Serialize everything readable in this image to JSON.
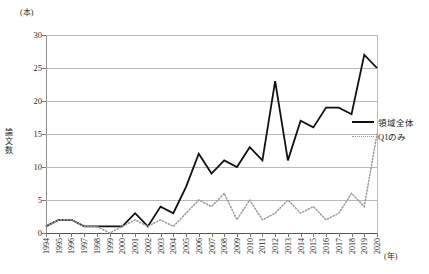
{
  "chart_data": {
    "type": "line",
    "title": "",
    "xlabel": "(年)",
    "ylabel": "論文数",
    "yunit": "(本)",
    "ylim": [
      0,
      30
    ],
    "yticks": [
      0,
      5,
      10,
      15,
      20,
      25,
      30
    ],
    "grid": true,
    "legend_position": "right",
    "categories": [
      "1994",
      "1995",
      "1996",
      "1997",
      "1998",
      "1999",
      "2000",
      "2001",
      "2002",
      "2003",
      "2004",
      "2005",
      "2006",
      "2007",
      "2008",
      "2009",
      "2010",
      "2011",
      "2012",
      "2013",
      "2014",
      "2015",
      "2016",
      "2017",
      "2018",
      "2019",
      "2020"
    ],
    "xtick_labels": [
      "1994",
      "1995",
      "1996",
      "1997",
      "1998",
      "1999",
      "2000",
      "2001",
      "2002",
      "2003",
      "2004",
      "2005",
      "2006",
      "2007",
      "2008",
      "2009",
      "2010",
      "2011",
      "2012",
      "2013",
      "2014",
      "2015",
      "2016",
      "2017",
      "2018",
      "2019",
      "2020"
    ],
    "series": [
      {
        "name": "領域全体",
        "style": "solid",
        "color": "#111111",
        "values": [
          1,
          2,
          2,
          1,
          1,
          1,
          1,
          3,
          1,
          4,
          3,
          7,
          12,
          9,
          11,
          10,
          13,
          11,
          23,
          11,
          17,
          16,
          19,
          19,
          18,
          27,
          25
        ]
      },
      {
        "name": "Q1のみ",
        "style": "dotted",
        "color": "#9a9a9a",
        "values": [
          1,
          2,
          2,
          1,
          1,
          0,
          1,
          2,
          1,
          2,
          1,
          3,
          5,
          4,
          6,
          2,
          5,
          2,
          3,
          5,
          3,
          4,
          2,
          3,
          6,
          4,
          15
        ]
      }
    ]
  },
  "legend": {
    "items": [
      {
        "label": "領域全体"
      },
      {
        "label": "Q1のみ"
      }
    ]
  }
}
